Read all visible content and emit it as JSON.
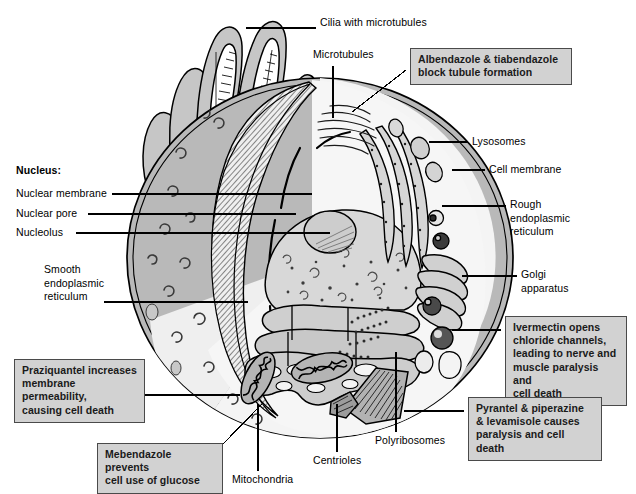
{
  "figure": {
    "background_color": "#ffffff",
    "line_color": "#000000",
    "callout_fill": "#d2d2d2",
    "callout_border": "#4a4a4a",
    "cytoplasm_color": "#f2f2f2",
    "outer_cell_color": "#b8b8b8",
    "nucleus_fill": "#dcdcdc"
  },
  "labels": [
    {
      "id": "cilia",
      "text": "Cilia with microtubules",
      "x": 320,
      "y": 22
    },
    {
      "id": "microtubules",
      "text": "Microtubules",
      "x": 313,
      "y": 54
    },
    {
      "id": "lysosomes",
      "text": "Lysosomes",
      "x": 472,
      "y": 137
    },
    {
      "id": "cell-membrane",
      "text": "Cell membrane",
      "x": 489,
      "y": 165
    },
    {
      "id": "nucleus-heading",
      "text": "Nucleus:",
      "x": 16,
      "y": 167,
      "bold": true
    },
    {
      "id": "nuclear-membrane",
      "text": "Nuclear membrane",
      "x": 16,
      "y": 189
    },
    {
      "id": "nuclear-pore",
      "text": "Nuclear pore",
      "x": 16,
      "y": 208
    },
    {
      "id": "nucleolus",
      "text": "Nucleolus",
      "x": 16,
      "y": 228
    },
    {
      "id": "rough-er",
      "text": "Rough\nendoplasmic\nreticulum",
      "x": 510,
      "y": 200
    },
    {
      "id": "smooth-er",
      "text": "Smooth\nendoplasmic\nreticulum",
      "x": 44,
      "y": 265
    },
    {
      "id": "golgi",
      "text": "Golgi\napparatus",
      "x": 521,
      "y": 270
    },
    {
      "id": "polyribosomes",
      "text": "Polyribosomes",
      "x": 375,
      "y": 437
    },
    {
      "id": "centrioles",
      "text": "Centrioles",
      "x": 313,
      "y": 457
    },
    {
      "id": "mitochondria",
      "text": "Mitochondria",
      "x": 232,
      "y": 476
    }
  ],
  "callouts": [
    {
      "id": "albendazole",
      "text": "Albendazole & tiabendazole\nblock tubule formation",
      "x": 410,
      "y": 48,
      "width": 162,
      "height": 32
    },
    {
      "id": "ivermectin",
      "text": "Ivermectin opens\nchloride channels,\nleading to nerve and\nmuscle paralysis and\ncell death",
      "x": 505,
      "y": 316,
      "width": 122,
      "height": 72
    },
    {
      "id": "praziquantel",
      "text": "Praziquantel increases\nmembrane permeability,\ncausing cell death",
      "x": 14,
      "y": 359,
      "width": 131,
      "height": 45
    },
    {
      "id": "pyrantel",
      "text": "Pyrantel & piperazine\n& levamisole causes\nparalysis and cell death",
      "x": 468,
      "y": 397,
      "width": 134,
      "height": 45
    },
    {
      "id": "mebendazole",
      "text": "Mebendazole prevents\ncell use of glucose",
      "x": 97,
      "y": 443,
      "width": 126,
      "height": 32
    }
  ],
  "organelles": [
    {
      "id": "cilium",
      "name": "cilia-with-microtubules",
      "count": 6
    },
    {
      "id": "nucleus",
      "name": "nucleus"
    },
    {
      "id": "nucleolus",
      "name": "nucleolus"
    },
    {
      "id": "rough-er",
      "name": "rough-endoplasmic-reticulum"
    },
    {
      "id": "smooth-er",
      "name": "smooth-endoplasmic-reticulum"
    },
    {
      "id": "golgi",
      "name": "golgi-apparatus"
    },
    {
      "id": "lysosome",
      "name": "lysosome",
      "count": 5
    },
    {
      "id": "mitochondrion",
      "name": "mitochondrion",
      "count": 2
    },
    {
      "id": "centriole",
      "name": "centriole-pair"
    },
    {
      "id": "polyribosome",
      "name": "polyribosome-cluster"
    },
    {
      "id": "microtubule",
      "name": "microtubule-bundle"
    }
  ]
}
